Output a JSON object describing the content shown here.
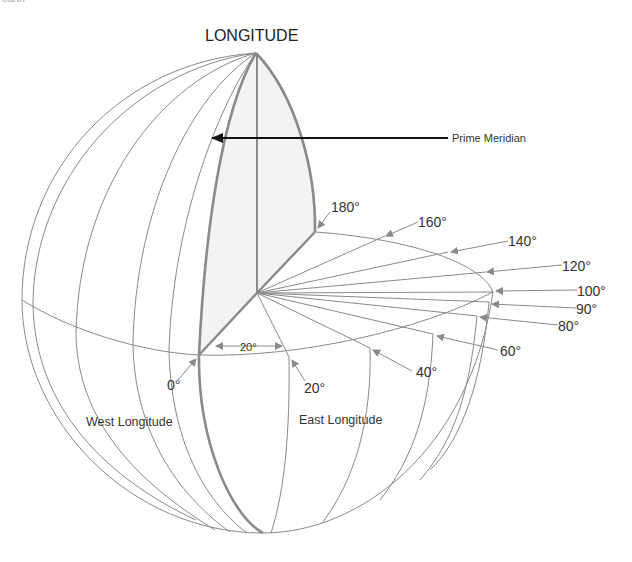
{
  "caption_fragment": "earth",
  "diagram": {
    "title": "LONGITUDE",
    "pointer_label": "Prime Meridian",
    "region_labels": {
      "west": "West Longitude",
      "east": "East Longitude"
    },
    "angle_label": "20°",
    "degree_labels": [
      {
        "id": "0",
        "text": "0°"
      },
      {
        "id": "20",
        "text": "20°"
      },
      {
        "id": "40",
        "text": "40°"
      },
      {
        "id": "60",
        "text": "60°"
      },
      {
        "id": "80",
        "text": "80°"
      },
      {
        "id": "90",
        "text": "90°"
      },
      {
        "id": "100",
        "text": "100°"
      },
      {
        "id": "120",
        "text": "120°"
      },
      {
        "id": "140",
        "text": "140°"
      },
      {
        "id": "160",
        "text": "160°"
      },
      {
        "id": "180",
        "text": "180°"
      }
    ],
    "colors": {
      "line": "#8a8a8a",
      "shade": "#f3f3f3",
      "pointer": "#111111",
      "text": "#333333"
    }
  }
}
